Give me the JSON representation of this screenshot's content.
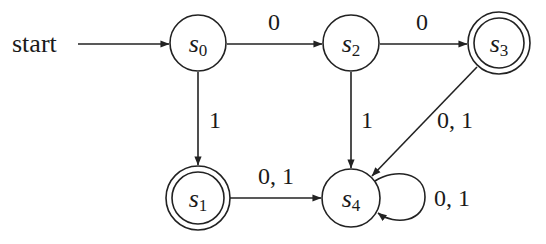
{
  "diagram": {
    "type": "finite-state-automaton",
    "start_label": "start",
    "start_state": "s0",
    "states": [
      {
        "id": "s0",
        "name": "s",
        "sub": "0",
        "accepting": false,
        "cx": 198,
        "cy": 43
      },
      {
        "id": "s1",
        "name": "s",
        "sub": "1",
        "accepting": true,
        "cx": 198,
        "cy": 198
      },
      {
        "id": "s2",
        "name": "s",
        "sub": "2",
        "accepting": false,
        "cx": 351,
        "cy": 43
      },
      {
        "id": "s3",
        "name": "s",
        "sub": "3",
        "accepting": true,
        "cx": 499,
        "cy": 43
      },
      {
        "id": "s4",
        "name": "s",
        "sub": "4",
        "accepting": false,
        "cx": 351,
        "cy": 198
      }
    ],
    "transitions": [
      {
        "from": "s0",
        "to": "s2",
        "label": "0"
      },
      {
        "from": "s0",
        "to": "s1",
        "label": "1"
      },
      {
        "from": "s2",
        "to": "s3",
        "label": "0"
      },
      {
        "from": "s2",
        "to": "s4",
        "label": "1"
      },
      {
        "from": "s3",
        "to": "s4",
        "label": "0, 1"
      },
      {
        "from": "s1",
        "to": "s4",
        "label": "0, 1"
      },
      {
        "from": "s4",
        "to": "s4",
        "label": "0, 1"
      }
    ]
  }
}
